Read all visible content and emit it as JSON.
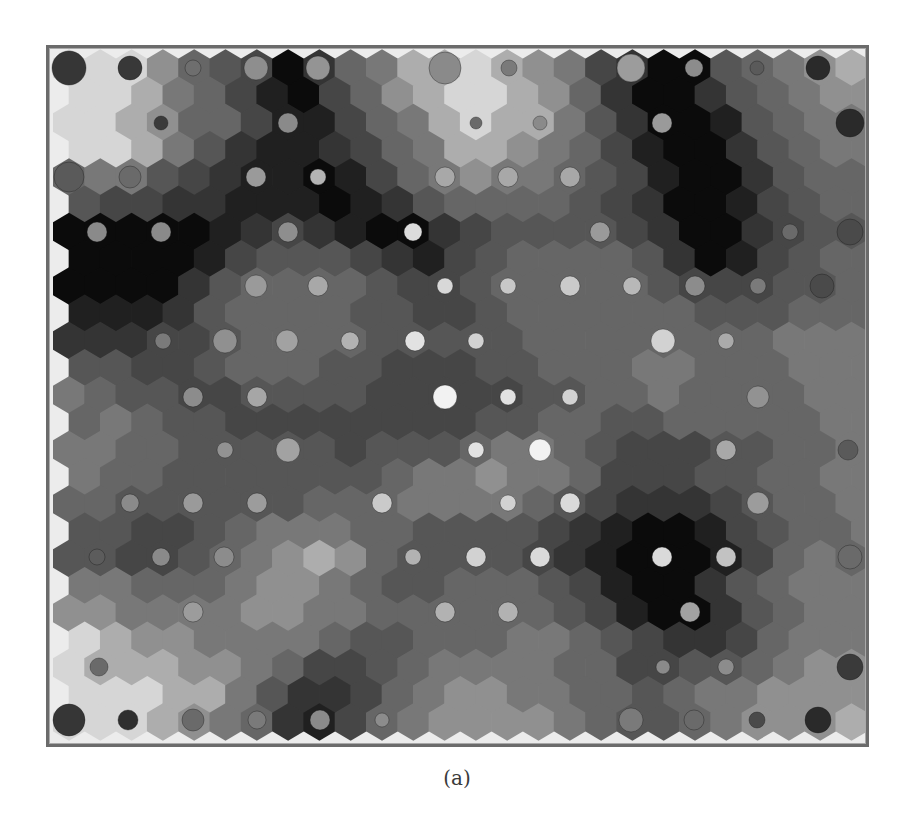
{
  "figure": {
    "caption": "(a)",
    "type": "self-organizing map (hexagonal U-matrix with hit markers)",
    "frame": {
      "x": 46,
      "y": 45,
      "width": 823,
      "height": 702,
      "outer_color": "#6b6b6b",
      "inner_color": "#a9a9a9",
      "background": "#ececec"
    },
    "grid": {
      "rows": 25,
      "cols": 26,
      "origin_x": 69,
      "origin_y": 68,
      "col_pitch": 31.3,
      "row_pitch": 27.25,
      "odd_row_offset": 15.65,
      "orientation": "pointy-top"
    },
    "palette": {
      "0": "#0b0b0b",
      "1": "#202020",
      "2": "#343434",
      "3": "#464646",
      "4": "#565656",
      "5": "#666666",
      "6": "#787878",
      "7": "#909090",
      "8": "#adadad",
      "9": "#d6d6d6"
    },
    "levels": [
      "99975430256889876320045678",
      "99865310357899875200245677",
      "99875531135689886420014566",
      "99864211235688765310024566",
      "56643211013567665431002455",
      "43322111012455554320013455",
      "00000123210023444432002344",
      "00001344432134555542013455",
      "00002455554334555554333445",
      "11124555544334555555444555",
      "22233455554444455555555666",
      "44334555443334455566555666",
      "65443344443333344556555566",
      "56544333333334455445555566",
      "66554444434445665433344556",
      "65544444445667665333445566",
      "55444444555666654322234556",
      "44334566655444432100134556",
      "44334567875444432100013565",
      "66555677654455543100245666",
      "77666677665555554310024566",
      "98776666544555665432235666",
      "98887765334566665533445677",
      "99988642235677665545667777",
      "99987652135677776544567778"
    ],
    "hits": [
      [
        69,
        68,
        17,
        "#363636"
      ],
      [
        130,
        68,
        12,
        "#383838"
      ],
      [
        193,
        68,
        8,
        "#6e6e6e"
      ],
      [
        256,
        68,
        12,
        "#8e8e8e"
      ],
      [
        318,
        68,
        12,
        "#949494"
      ],
      [
        445,
        68,
        16,
        "#8a8a8a"
      ],
      [
        509,
        68,
        8,
        "#7a7a7a"
      ],
      [
        631,
        68,
        14,
        "#9c9c9c"
      ],
      [
        694,
        68,
        9,
        "#8c8c8c"
      ],
      [
        757,
        68,
        7,
        "#5a5a5a"
      ],
      [
        818,
        68,
        12,
        "#2a2a2a"
      ],
      [
        161,
        123,
        7,
        "#3a3a3a"
      ],
      [
        288,
        123,
        10,
        "#8a8a8a"
      ],
      [
        476,
        123,
        6,
        "#6a6a6a"
      ],
      [
        540,
        123,
        7,
        "#8a8a8a"
      ],
      [
        662,
        123,
        10,
        "#9a9a9a"
      ],
      [
        850,
        123,
        14,
        "#2a2a2a"
      ],
      [
        69,
        177,
        15,
        "#5a5a5a"
      ],
      [
        130,
        177,
        11,
        "#6a6a6a"
      ],
      [
        256,
        177,
        10,
        "#9a9a9a"
      ],
      [
        318,
        177,
        8,
        "#b4b4b4"
      ],
      [
        445,
        177,
        10,
        "#a8a8a8"
      ],
      [
        508,
        177,
        10,
        "#a8a8a8"
      ],
      [
        570,
        177,
        10,
        "#a8a8a8"
      ],
      [
        97,
        232,
        10,
        "#8a8a8a"
      ],
      [
        161,
        232,
        10,
        "#8a8a8a"
      ],
      [
        288,
        232,
        10,
        "#8e8e8e"
      ],
      [
        413,
        232,
        9,
        "#dcdcdc"
      ],
      [
        600,
        232,
        10,
        "#9a9a9a"
      ],
      [
        790,
        232,
        8,
        "#6a6a6a"
      ],
      [
        850,
        232,
        13,
        "#4a4a4a"
      ],
      [
        256,
        286,
        11,
        "#9a9a9a"
      ],
      [
        318,
        286,
        10,
        "#a8a8a8"
      ],
      [
        445,
        286,
        8,
        "#d8d8d8"
      ],
      [
        508,
        286,
        8,
        "#c8c8c8"
      ],
      [
        570,
        286,
        10,
        "#cacaca"
      ],
      [
        632,
        286,
        9,
        "#b8b8b8"
      ],
      [
        695,
        286,
        10,
        "#8c8c8c"
      ],
      [
        758,
        286,
        8,
        "#7a7a7a"
      ],
      [
        822,
        286,
        12,
        "#4a4a4a"
      ],
      [
        163,
        341,
        8,
        "#7a7a7a"
      ],
      [
        225,
        341,
        12,
        "#909090"
      ],
      [
        287,
        341,
        11,
        "#a2a2a2"
      ],
      [
        350,
        341,
        9,
        "#b2b2b2"
      ],
      [
        415,
        341,
        10,
        "#e2e2e2"
      ],
      [
        476,
        341,
        8,
        "#d2d2d2"
      ],
      [
        663,
        341,
        12,
        "#d2d2d2"
      ],
      [
        726,
        341,
        8,
        "#aaaaaa"
      ],
      [
        193,
        397,
        10,
        "#8c8c8c"
      ],
      [
        257,
        397,
        10,
        "#a6a6a6"
      ],
      [
        445,
        397,
        12,
        "#f2f2f2"
      ],
      [
        508,
        397,
        8,
        "#e2e2e2"
      ],
      [
        570,
        397,
        8,
        "#d2d2d2"
      ],
      [
        758,
        397,
        11,
        "#929292"
      ],
      [
        225,
        450,
        8,
        "#929292"
      ],
      [
        288,
        450,
        12,
        "#a2a2a2"
      ],
      [
        476,
        450,
        8,
        "#e2e2e2"
      ],
      [
        540,
        450,
        11,
        "#f2f2f2"
      ],
      [
        726,
        450,
        10,
        "#a8a8a8"
      ],
      [
        848,
        450,
        10,
        "#5a5a5a"
      ],
      [
        130,
        503,
        9,
        "#8a8a8a"
      ],
      [
        193,
        503,
        10,
        "#9a9a9a"
      ],
      [
        257,
        503,
        10,
        "#9c9c9c"
      ],
      [
        382,
        503,
        10,
        "#cacaca"
      ],
      [
        508,
        503,
        8,
        "#d2d2d2"
      ],
      [
        570,
        503,
        10,
        "#dadada"
      ],
      [
        758,
        503,
        11,
        "#9c9c9c"
      ],
      [
        97,
        557,
        8,
        "#5c5c5c"
      ],
      [
        161,
        557,
        9,
        "#8a8a8a"
      ],
      [
        224,
        557,
        10,
        "#8c8c8c"
      ],
      [
        413,
        557,
        8,
        "#b2b2b2"
      ],
      [
        476,
        557,
        10,
        "#d2d2d2"
      ],
      [
        540,
        557,
        10,
        "#dadada"
      ],
      [
        662,
        557,
        10,
        "#dadada"
      ],
      [
        726,
        557,
        10,
        "#c2c2c2"
      ],
      [
        850,
        557,
        12,
        "#6a6a6a"
      ],
      [
        193,
        612,
        10,
        "#9c9c9c"
      ],
      [
        445,
        612,
        10,
        "#b2b2b2"
      ],
      [
        508,
        612,
        10,
        "#b2b2b2"
      ],
      [
        690,
        612,
        10,
        "#a2a2a2"
      ],
      [
        99,
        667,
        9,
        "#6a6a6a"
      ],
      [
        663,
        667,
        7,
        "#8a8a8a"
      ],
      [
        726,
        667,
        8,
        "#8c8c8c"
      ],
      [
        850,
        667,
        13,
        "#3a3a3a"
      ],
      [
        69,
        720,
        16,
        "#363636"
      ],
      [
        128,
        720,
        10,
        "#2e2e2e"
      ],
      [
        193,
        720,
        11,
        "#6a6a6a"
      ],
      [
        257,
        720,
        9,
        "#7a7a7a"
      ],
      [
        320,
        720,
        10,
        "#8a8a8a"
      ],
      [
        382,
        720,
        7,
        "#8c8c8c"
      ],
      [
        631,
        720,
        12,
        "#7a7a7a"
      ],
      [
        694,
        720,
        10,
        "#6a6a6a"
      ],
      [
        757,
        720,
        8,
        "#4a4a4a"
      ],
      [
        818,
        720,
        13,
        "#2a2a2a"
      ]
    ]
  }
}
